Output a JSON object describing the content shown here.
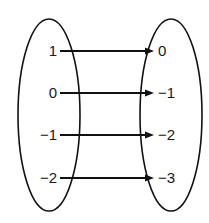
{
  "diagram": {
    "type": "mapping",
    "domain_set": {
      "values": [
        "1",
        "0",
        "−1",
        "−2"
      ]
    },
    "range_set": {
      "values": [
        "0",
        "−1",
        "−2",
        "−3"
      ]
    },
    "mappings": [
      {
        "from": "1",
        "to": "0"
      },
      {
        "from": "0",
        "to": "−1"
      },
      {
        "from": "−1",
        "to": "−2"
      },
      {
        "from": "−2",
        "to": "−3"
      }
    ],
    "colors": {
      "stroke": "#111111",
      "text": "#1a1a1a",
      "background": "#ffffff"
    }
  }
}
